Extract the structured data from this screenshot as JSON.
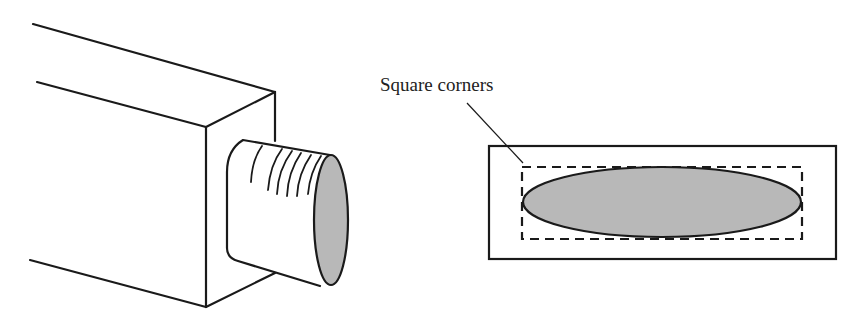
{
  "figure": {
    "left": {
      "description": "Bar with oval tenon (isometric view)",
      "tenon_end_fill": "#b8b8b8"
    },
    "right": {
      "description": "End view of oval tenon inside square-cornered outline",
      "callout_label": "Square corners",
      "ellipse_fill": "#b8b8b8",
      "stroke_color": "#1a1a1a"
    }
  }
}
